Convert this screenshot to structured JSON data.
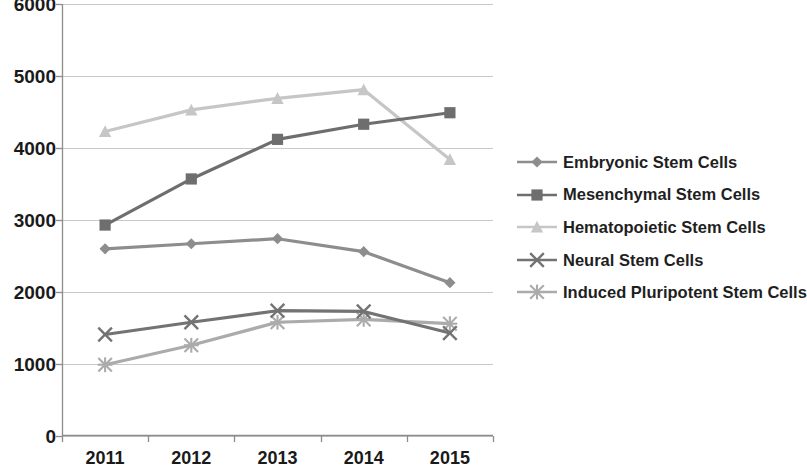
{
  "chart_data": {
    "type": "line",
    "title": "",
    "subtitle": "",
    "xlabel": "",
    "ylabel": "",
    "categories": [
      "2011",
      "2012",
      "2013",
      "2014",
      "2015"
    ],
    "ylim": [
      0,
      6000
    ],
    "ytick_labels": [
      "0",
      "1000",
      "2000",
      "3000",
      "4000",
      "5000",
      "6000"
    ],
    "ytick_values": [
      0,
      1000,
      2000,
      3000,
      4000,
      5000,
      6000
    ],
    "grid": true,
    "grid_axis": "y",
    "legend_position": "right",
    "series": [
      {
        "name": "Embryonic Stem Cells",
        "values": [
          2600,
          2670,
          2740,
          2560,
          2130
        ],
        "color": "#8d8d8d",
        "marker": "diamond"
      },
      {
        "name": "Mesenchymal Stem Cells",
        "values": [
          2930,
          3570,
          4120,
          4330,
          4490
        ],
        "color": "#6e6e6e",
        "marker": "square"
      },
      {
        "name": "Hematopoietic Stem Cells",
        "values": [
          4230,
          4530,
          4690,
          4810,
          3840
        ],
        "color": "#c6c6c6",
        "marker": "triangle"
      },
      {
        "name": "Neural Stem Cells",
        "values": [
          1410,
          1580,
          1740,
          1730,
          1430
        ],
        "color": "#737373",
        "marker": "x"
      },
      {
        "name": "Induced Pluripotent Stem Cells",
        "values": [
          990,
          1260,
          1580,
          1620,
          1560
        ],
        "color": "#ababab",
        "marker": "star"
      }
    ]
  },
  "axes": {
    "axis_line_color": "#8c8c8c",
    "grid_color": "#c9c9c9"
  }
}
